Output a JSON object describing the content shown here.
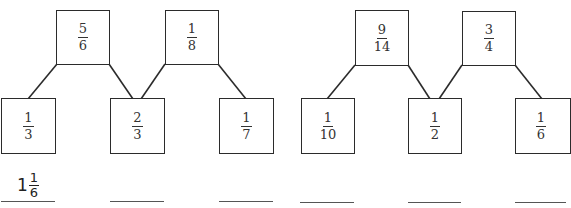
{
  "worksheet": {
    "puzzles": [
      {
        "top": [
          {
            "num": "5",
            "den": "6"
          },
          {
            "num": "1",
            "den": "8"
          }
        ],
        "bottom": [
          {
            "num": "1",
            "den": "3"
          },
          {
            "num": "2",
            "den": "3"
          },
          {
            "num": "1",
            "den": "7"
          }
        ],
        "answers": [
          {
            "whole": "1",
            "num": "1",
            "den": "6"
          },
          null,
          null
        ]
      },
      {
        "top": [
          {
            "num": "9",
            "den": "14"
          },
          {
            "num": "3",
            "den": "4"
          }
        ],
        "bottom": [
          {
            "num": "1",
            "den": "10"
          },
          {
            "num": "1",
            "den": "2"
          },
          {
            "num": "1",
            "den": "6"
          }
        ],
        "answers": [
          null,
          null,
          null
        ]
      }
    ]
  },
  "colors": {
    "stroke": "#2b2b2b",
    "answer_line": "#555555",
    "background": "#ffffff"
  }
}
